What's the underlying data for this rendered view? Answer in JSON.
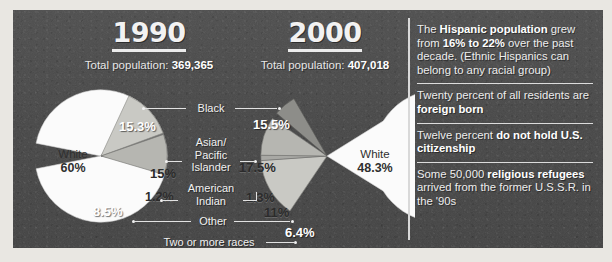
{
  "panel": {
    "background_color": "#474747",
    "divider_color": "#d9d9d9"
  },
  "charts": [
    {
      "year": "1990",
      "total_label": "Total population: ",
      "total_value": "369,365",
      "white_name": "White",
      "white_value": "60%",
      "values": {
        "black": "15.3%",
        "asian": "15%",
        "american_indian": "1.2%",
        "other": "8.5%"
      }
    },
    {
      "year": "2000",
      "total_label": "Total population: ",
      "total_value": "407,018",
      "white_name": "White",
      "white_value": "48.3%",
      "values": {
        "black": "15.5%",
        "asian": "17.5%",
        "american_indian": "1.3%",
        "other": "11%",
        "two_or_more": "6.4%"
      }
    }
  ],
  "category_labels": {
    "black": "Black",
    "asian": "Asian/\nPacific\nIslander",
    "asian_line1": "Asian/",
    "asian_line2": "Pacific",
    "asian_line3": "Islander",
    "american_indian_line1": "American",
    "american_indian_line2": "Indian",
    "other": "Other",
    "two_or_more": "Two or more races"
  },
  "sidebar": {
    "facts": [
      {
        "parts": [
          {
            "t": "The ",
            "b": false
          },
          {
            "t": "Hispanic population",
            "b": true
          },
          {
            "t": " grew from ",
            "b": false
          },
          {
            "t": "16% to 22%",
            "b": true
          },
          {
            "t": " over the past decade. (Ethnic Hispanics can belong to any racial group)",
            "b": false
          }
        ]
      },
      {
        "parts": [
          {
            "t": "Twenty percent of all residents are ",
            "b": false
          },
          {
            "t": "foreign born",
            "b": true
          }
        ]
      },
      {
        "parts": [
          {
            "t": "Twelve percent ",
            "b": false
          },
          {
            "t": "do not hold U.S. citizenship",
            "b": true
          }
        ]
      },
      {
        "parts": [
          {
            "t": "Some 50,000 ",
            "b": false
          },
          {
            "t": "religious refugees",
            "b": true
          },
          {
            "t": " arrived from the former U.S.S.R. in the '90s",
            "b": false
          }
        ]
      }
    ]
  },
  "chart_data": [
    {
      "type": "pie",
      "title": "1990",
      "subtitle": "Total population: 369,365",
      "categories": [
        "White",
        "Black",
        "Asian/Pacific Islander",
        "American Indian",
        "Other"
      ],
      "values": [
        60,
        15.3,
        15,
        1.2,
        8.5
      ],
      "labels": [
        "60%",
        "15.3%",
        "15%",
        "1.2%",
        "8.5%"
      ],
      "legend": "inline-callouts",
      "grid": false
    },
    {
      "type": "pie",
      "title": "2000",
      "subtitle": "Total population: 407,018",
      "categories": [
        "White",
        "Black",
        "Asian/Pacific Islander",
        "American Indian",
        "Other",
        "Two or more races"
      ],
      "values": [
        48.3,
        15.5,
        17.5,
        1.3,
        11,
        6.4
      ],
      "labels": [
        "48.3%",
        "15.5%",
        "17.5%",
        "1.3%",
        "11%",
        "6.4%"
      ],
      "legend": "inline-callouts",
      "grid": false
    }
  ]
}
